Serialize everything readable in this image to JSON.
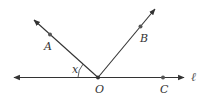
{
  "diagram": {
    "line_label": "ℓ",
    "angle_label": "x",
    "points": {
      "O": {
        "label": "O"
      },
      "A": {
        "label": "A"
      },
      "B": {
        "label": "B"
      },
      "C": {
        "label": "C"
      }
    },
    "colors": {
      "line": "#333333",
      "point": "#555555",
      "text": "#333333"
    }
  }
}
